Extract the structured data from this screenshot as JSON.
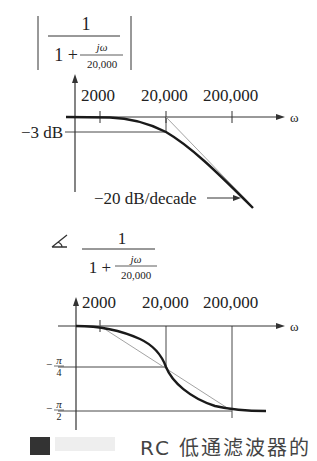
{
  "magnitude_plot": {
    "formula": {
      "numerator": "1",
      "denominator_prefix": "1 +",
      "inner_numerator": "jω",
      "inner_denominator": "20,000"
    },
    "x_ticks": [
      "2000",
      "20,000",
      "200,000"
    ],
    "x_axis_label": "ω",
    "y_marker_label": "−3 dB",
    "slope_annotation": "−20 dB/decade"
  },
  "phase_plot": {
    "angle_symbol": "∡",
    "formula": {
      "numerator": "1",
      "denominator_prefix": "1 +",
      "inner_numerator": "jω",
      "inner_denominator": "20,000"
    },
    "x_ticks": [
      "2000",
      "20,000",
      "200,000"
    ],
    "x_axis_label": "ω",
    "y_labels": [
      {
        "sign": "−",
        "num": "π",
        "den": "4"
      },
      {
        "sign": "−",
        "num": "π",
        "den": "2"
      }
    ]
  },
  "caption": {
    "partial_text": "RC 低通滤波器的"
  },
  "colors": {
    "curve": "#1a1a1a",
    "asymptote": "#888888",
    "axis": "#333333"
  }
}
